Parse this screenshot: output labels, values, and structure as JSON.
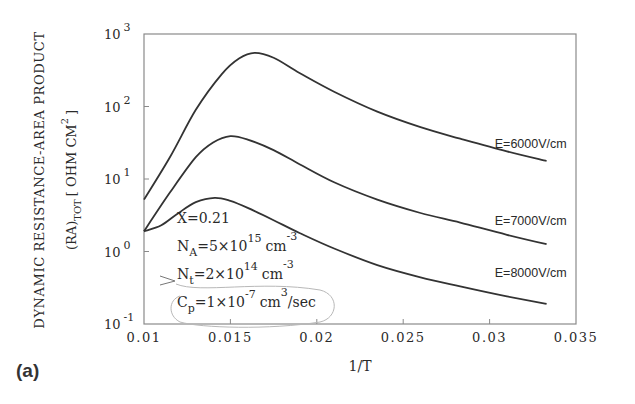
{
  "chart_data": {
    "type": "line",
    "title": "",
    "panel_label": "(a)",
    "xlabel": "1/T",
    "ylabel_line1": "DYNAMIC RESISTANCE-AREA PRODUCT",
    "ylabel_line2_main": "(RA)",
    "ylabel_line2_sub": "TOT",
    "ylabel_line2_unit": "[ OHM CM",
    "ylabel_line2_sup": "2",
    "ylabel_line2_close": "]",
    "xlim": [
      0.01,
      0.035
    ],
    "ylim": [
      0.1,
      1000
    ],
    "yscale": "log",
    "xticks": [
      {
        "value": 0.01,
        "label": "0.01"
      },
      {
        "value": 0.015,
        "label": "0.015"
      },
      {
        "value": 0.02,
        "label": "0.02"
      },
      {
        "value": 0.025,
        "label": "0.025"
      },
      {
        "value": 0.03,
        "label": "0.03"
      },
      {
        "value": 0.035,
        "label": "0.035"
      }
    ],
    "yticks": [
      {
        "value": 1000,
        "base": "10",
        "exp": "3"
      },
      {
        "value": 100,
        "base": "10",
        "exp": "2"
      },
      {
        "value": 10,
        "base": "10",
        "exp": "1"
      },
      {
        "value": 1,
        "base": "10",
        "exp": "0"
      },
      {
        "value": 0.1,
        "base": "10",
        "exp": "-1"
      }
    ],
    "grid": false,
    "series": [
      {
        "name": "E=6000V/cm",
        "x": [
          0.01,
          0.0115,
          0.013,
          0.0145,
          0.0155,
          0.0164,
          0.0175,
          0.019,
          0.021,
          0.0235,
          0.026,
          0.0283,
          0.031,
          0.0333
        ],
        "y": [
          5.2,
          20,
          90,
          280,
          460,
          550,
          470,
          290,
          160,
          85,
          52,
          36,
          24,
          17.7
        ]
      },
      {
        "name": "E=7000V/cm",
        "x": [
          0.01,
          0.0115,
          0.013,
          0.014,
          0.015,
          0.016,
          0.0175,
          0.019,
          0.021,
          0.0235,
          0.026,
          0.0283,
          0.031,
          0.0333
        ],
        "y": [
          1.9,
          6.5,
          20,
          32,
          39,
          35,
          25,
          16,
          9,
          5.2,
          3.4,
          2.5,
          1.7,
          1.26
        ]
      },
      {
        "name": "E=8000V/cm",
        "x": [
          0.01,
          0.011,
          0.012,
          0.013,
          0.0141,
          0.015,
          0.016,
          0.0175,
          0.019,
          0.021,
          0.0235,
          0.026,
          0.0283,
          0.031,
          0.0333
        ],
        "y": [
          1.9,
          2.3,
          3.4,
          4.8,
          5.5,
          5.0,
          4.0,
          2.7,
          1.8,
          1.1,
          0.65,
          0.44,
          0.33,
          0.24,
          0.19
        ]
      }
    ],
    "series_labels": [
      {
        "text": "E=6000V/cm",
        "x": 0.0303,
        "y": 27
      },
      {
        "text": "E=7000V/cm",
        "x": 0.0303,
        "y": 2.3
      },
      {
        "text": "E=8000V/cm",
        "x": 0.0303,
        "y": 0.44
      }
    ],
    "annotations": [
      {
        "main": "X=0.21"
      },
      {
        "main": "N",
        "sub": "A",
        "rest": "=5×10",
        "sup": "15",
        "unit": "cm",
        "unit_sup": "-3"
      },
      {
        "main": "N",
        "sub": "t",
        "rest": "=2×10",
        "sup": "14",
        "unit": "cm",
        "unit_sup": "-3"
      },
      {
        "main": "C",
        "sub": "p",
        "rest": "=1×10",
        "sup": "-7",
        "unit": "cm",
        "unit_sup": "3",
        "tail": "/sec"
      }
    ],
    "colors": {
      "line": "#333333",
      "axis": "#8a8a8a",
      "text": "#2a2a2a",
      "handwriting": "#b8b8b8"
    }
  }
}
